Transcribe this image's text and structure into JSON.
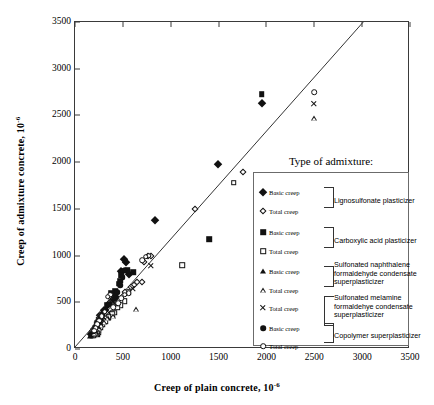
{
  "chart": {
    "type": "scatter",
    "title": "",
    "xlabel": "Creep of plain concrete, 10",
    "xlabel_sup": "-6",
    "ylabel": "Creep of admixture concrete, 10",
    "ylabel_sup": "-6",
    "xlim": [
      0,
      3500
    ],
    "ylim": [
      0,
      3500
    ],
    "xticks": [
      "0",
      "500",
      "1000",
      "1500",
      "2000",
      "2500",
      "3000",
      "3500"
    ],
    "yticks": [
      "0",
      "500",
      "1000",
      "1500",
      "2000",
      "2500",
      "3000",
      "3500"
    ],
    "grid": false,
    "reference_line": {
      "label": "equality line (y = x)",
      "from": [
        0,
        0
      ],
      "to": [
        3030,
        3500
      ]
    }
  },
  "legend": {
    "title": "Type of admixture:",
    "position": "inside-lower-right",
    "groups": [
      {
        "name": "Lignosulfonate plasticizer",
        "rows": [
          {
            "marker": "filled-diamond",
            "label": "Basic creep"
          },
          {
            "marker": "open-diamond",
            "label": "Total creep"
          }
        ]
      },
      {
        "name": "Carboxylic acid plasticizer",
        "rows": [
          {
            "marker": "filled-square",
            "label": "Basic creep"
          },
          {
            "marker": "open-square",
            "label": "Total creep"
          }
        ]
      },
      {
        "name": "Sulfonated naphthalene formaldehyde condensate superplasticizer",
        "name_lines": [
          "Sulfonated naphthalene",
          "formaldehyde condensate",
          "superplasticizer"
        ],
        "rows": [
          {
            "marker": "filled-triangle",
            "label": "Basic creep"
          },
          {
            "marker": "open-triangle",
            "label": "Total creep"
          }
        ]
      },
      {
        "name": "Sulfonated melamine formaldehye condensate superplasticizer",
        "name_lines": [
          "Sulfonated melamine",
          "formaldehye condensate",
          "superplasticizer"
        ],
        "rows": [
          {
            "marker": "cross",
            "label": "Total creep"
          }
        ]
      },
      {
        "name": "Copolymer superplasticizer",
        "rows": [
          {
            "marker": "filled-circle",
            "label": "Basic creep"
          },
          {
            "marker": "open-circle",
            "label": "Total creep"
          }
        ]
      }
    ]
  },
  "chart_data": {
    "type": "scatter",
    "title": "",
    "xlabel": "Creep of plain concrete, 10^-6",
    "ylabel": "Creep of admixture concrete, 10^-6",
    "xlim": [
      0,
      3500
    ],
    "ylim": [
      0,
      3500
    ],
    "xticks": [
      0,
      500,
      1000,
      1500,
      2000,
      2500,
      3000,
      3500
    ],
    "yticks": [
      0,
      500,
      1000,
      1500,
      2000,
      2500,
      3000,
      3500
    ],
    "grid": false,
    "reference_line": "y = x",
    "series": [
      {
        "name": "Lignosulfonate plasticizer - Basic creep",
        "marker": "filled-diamond",
        "points": [
          [
            1950,
            2630
          ],
          [
            1490,
            1985
          ],
          [
            840,
            1380
          ],
          [
            510,
            960
          ],
          [
            530,
            930
          ],
          [
            480,
            840
          ],
          [
            560,
            800
          ],
          [
            430,
            560
          ],
          [
            390,
            520
          ],
          [
            300,
            420
          ],
          [
            260,
            360
          ],
          [
            240,
            300
          ],
          [
            220,
            250
          ],
          [
            200,
            215
          ],
          [
            185,
            190
          ],
          [
            175,
            170
          ],
          [
            165,
            160
          ]
        ]
      },
      {
        "name": "Lignosulfonate plasticizer - Total creep",
        "marker": "open-diamond",
        "points": [
          [
            1760,
            1890
          ],
          [
            1250,
            1500
          ],
          [
            790,
            995
          ],
          [
            760,
            1000
          ],
          [
            720,
            930
          ],
          [
            700,
            720
          ],
          [
            650,
            720
          ],
          [
            620,
            680
          ],
          [
            580,
            660
          ],
          [
            520,
            610
          ],
          [
            390,
            580
          ],
          [
            350,
            490
          ],
          [
            320,
            420
          ],
          [
            290,
            390
          ],
          [
            255,
            330
          ],
          [
            235,
            280
          ],
          [
            215,
            235
          ],
          [
            200,
            200
          ],
          [
            190,
            180
          ]
        ]
      },
      {
        "name": "Carboxylic acid plasticizer - Basic creep",
        "marker": "filled-square",
        "points": [
          [
            1950,
            2730
          ],
          [
            1400,
            1175
          ],
          [
            610,
            820
          ],
          [
            530,
            840
          ],
          [
            550,
            845
          ],
          [
            500,
            840
          ],
          [
            480,
            790
          ],
          [
            470,
            730
          ],
          [
            455,
            700
          ],
          [
            420,
            620
          ],
          [
            380,
            600
          ],
          [
            330,
            470
          ],
          [
            300,
            400
          ],
          [
            270,
            330
          ],
          [
            250,
            290
          ],
          [
            235,
            250
          ],
          [
            225,
            215
          ],
          [
            215,
            185
          ],
          [
            205,
            170
          ],
          [
            195,
            160
          ],
          [
            185,
            150
          ],
          [
            175,
            145
          ],
          [
            230,
            160
          ],
          [
            245,
            175
          ],
          [
            210,
            200
          ]
        ]
      },
      {
        "name": "Carboxylic acid plasticizer - Total creep",
        "marker": "open-square",
        "points": [
          [
            1660,
            1780
          ],
          [
            1120,
            900
          ],
          [
            560,
            610
          ],
          [
            520,
            510
          ],
          [
            470,
            470
          ],
          [
            440,
            440
          ],
          [
            410,
            390
          ],
          [
            390,
            370
          ],
          [
            350,
            340
          ],
          [
            320,
            300
          ],
          [
            290,
            260
          ],
          [
            265,
            230
          ],
          [
            245,
            200
          ],
          [
            230,
            185
          ],
          [
            215,
            170
          ],
          [
            205,
            160
          ],
          [
            195,
            150
          ]
        ]
      },
      {
        "name": "Sulfonated naphthalene formaldehyde condensate superplasticizer - Basic creep",
        "marker": "filled-triangle",
        "points": [
          [
            300,
            420
          ],
          [
            280,
            390
          ],
          [
            260,
            350
          ],
          [
            240,
            310
          ],
          [
            225,
            270
          ],
          [
            215,
            240
          ],
          [
            205,
            215
          ],
          [
            195,
            195
          ],
          [
            185,
            175
          ],
          [
            175,
            160
          ],
          [
            165,
            150
          ],
          [
            155,
            140
          ]
        ]
      },
      {
        "name": "Sulfonated naphthalene formaldehyde condensate superplasticizer - Total creep",
        "marker": "open-triangle",
        "points": [
          [
            2500,
            2470
          ],
          [
            640,
            425
          ],
          [
            400,
            355
          ],
          [
            340,
            330
          ],
          [
            300,
            290
          ],
          [
            270,
            255
          ],
          [
            250,
            225
          ],
          [
            230,
            200
          ],
          [
            215,
            180
          ],
          [
            200,
            165
          ]
        ]
      },
      {
        "name": "Sulfonated melamine formaldehye condensate superplasticizer - Total creep",
        "marker": "cross",
        "points": [
          [
            2500,
            2620
          ],
          [
            790,
            895
          ],
          [
            600,
            640
          ],
          [
            420,
            480
          ],
          [
            350,
            390
          ],
          [
            300,
            330
          ],
          [
            265,
            280
          ],
          [
            240,
            240
          ],
          [
            220,
            210
          ]
        ]
      },
      {
        "name": "Copolymer superplasticizer - Basic creep",
        "marker": "filled-circle",
        "points": [
          [
            520,
            850
          ],
          [
            500,
            770
          ],
          [
            470,
            680
          ],
          [
            440,
            610
          ],
          [
            410,
            560
          ],
          [
            360,
            480
          ],
          [
            320,
            420
          ],
          [
            290,
            370
          ],
          [
            260,
            320
          ],
          [
            240,
            280
          ],
          [
            220,
            240
          ],
          [
            205,
            205
          ],
          [
            195,
            185
          ]
        ]
      },
      {
        "name": "Copolymer superplasticizer - Total creep",
        "marker": "open-circle",
        "points": [
          [
            2500,
            2750
          ],
          [
            770,
            1000
          ],
          [
            740,
            990
          ],
          [
            700,
            950
          ],
          [
            560,
            600
          ],
          [
            520,
            580
          ],
          [
            480,
            545
          ],
          [
            450,
            490
          ],
          [
            400,
            450
          ],
          [
            370,
            580
          ],
          [
            340,
            560
          ],
          [
            310,
            400
          ],
          [
            280,
            350
          ],
          [
            255,
            305
          ],
          [
            235,
            265
          ],
          [
            215,
            225
          ],
          [
            200,
            195
          ]
        ]
      }
    ]
  }
}
